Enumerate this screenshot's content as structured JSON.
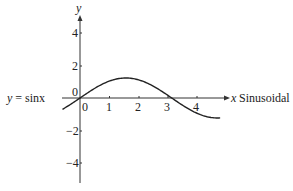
{
  "chart_data": {
    "type": "line",
    "title": "",
    "xlabel": "x",
    "ylabel": "y",
    "annotation_left": "y = sinx",
    "annotation_right": "Sinusoidal",
    "x_ticks": [
      "0",
      "1",
      "2",
      "3",
      "4"
    ],
    "y_ticks": [
      "4",
      "2",
      "0",
      "-2",
      "-4"
    ],
    "xlim": [
      -0.6,
      5.0
    ],
    "ylim": [
      -5.2,
      5.1
    ],
    "grid": false,
    "series": [
      {
        "name": "y = sinx",
        "function": "sin(x)",
        "x_range": [
          -0.6,
          4.8
        ]
      }
    ],
    "colors": {
      "axis": "#333333",
      "curve": "#222222",
      "text": "#222222"
    }
  },
  "labels": {
    "y_axis": "y",
    "x_axis": "x",
    "curve_label": "y = sinx",
    "right_label": "Sinusoidal",
    "origin_y": "0",
    "x_ticks": [
      "0",
      "1",
      "2",
      "3",
      "4"
    ],
    "y_ticks": [
      "4",
      "2",
      "−2",
      "−4"
    ]
  }
}
